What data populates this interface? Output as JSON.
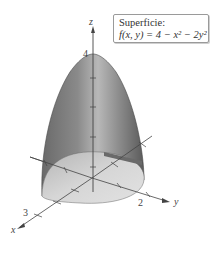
{
  "figure": {
    "title": "Superficie:",
    "function": "f(x, y) = 4 − x² − 2y²",
    "axes": {
      "x_label": "x",
      "y_label": "y",
      "z_label": "z"
    },
    "ticks": {
      "z_max": "4",
      "x_tick": "3",
      "y_tick": "2"
    },
    "colors": {
      "surface_dark": "#555555",
      "surface_light": "#b0b0b0",
      "base_fill": "#d4d4d4",
      "axis": "#444444"
    }
  }
}
